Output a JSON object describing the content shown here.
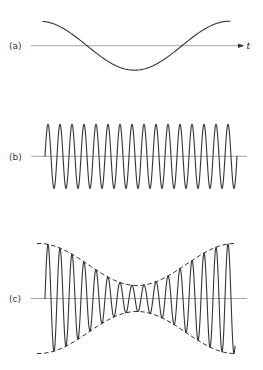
{
  "figure": {
    "background_color": "#ffffff",
    "signal_color": "#343434",
    "axis_color": "#8e8e8e",
    "label_color": "#333333"
  },
  "panels": [
    {
      "id": "a",
      "label": "(a)",
      "label_pos": {
        "x": 9,
        "y": 49
      },
      "axis": {
        "x1": 31,
        "x2": 238,
        "y": 45.7,
        "arrow": true
      },
      "axis_label": "t",
      "axis_label_pos": {
        "x": 246.5,
        "y": 48.5
      },
      "wave": {
        "type": "slow",
        "shape": "sine",
        "role": "modulating-signal",
        "x1": 43,
        "x2": 230,
        "peak_x": 39.5,
        "half_period": 95,
        "amplitude": 24.5
      }
    },
    {
      "id": "b",
      "label": "(b)",
      "label_pos": {
        "x": 9,
        "y": 160
      },
      "axis": {
        "x1": 31,
        "x2": 247,
        "y": 156.3,
        "arrow": false
      },
      "wave": {
        "type": "carrier",
        "shape": "sine",
        "role": "carrier-signal",
        "x1": 45,
        "x2": 237,
        "period": 12,
        "amplitude": 32
      }
    },
    {
      "id": "c",
      "label": "(c)",
      "label_pos": {
        "x": 9,
        "y": 302
      },
      "axis": {
        "x1": 31,
        "x2": 247,
        "y": 298.5,
        "arrow": false
      },
      "wave": {
        "type": "am",
        "shape": "amplitude-modulated-sine",
        "role": "modulated-signal",
        "x1": 45,
        "x2": 235,
        "period": 12,
        "envelope": {
          "center_x": 137,
          "half_width": 98,
          "a_max": 55,
          "a_min": 13,
          "x1": 37,
          "x2": 235,
          "dash": "4.5,2.6"
        }
      }
    }
  ]
}
